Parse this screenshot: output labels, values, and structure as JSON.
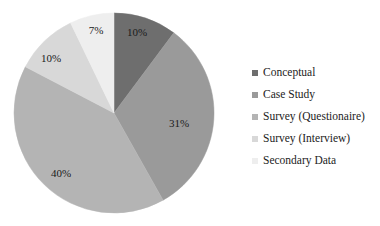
{
  "chart_data": {
    "type": "pie",
    "title": "",
    "categories": [
      "Conceptual",
      "Case Study",
      "Survey (Questionaire)",
      "Survey (Interview)",
      "Secondary Data"
    ],
    "values": [
      10,
      31,
      40,
      10,
      7
    ],
    "data_labels": [
      "10%",
      "31%",
      "40%",
      "10%",
      "7%"
    ],
    "colors": [
      "#6e6e6e",
      "#9a9a9a",
      "#b4b4b4",
      "#d8d8d8",
      "#eeeeee"
    ],
    "start_angle_deg": 0,
    "direction": "clockwise",
    "legend_position": "right",
    "grid": false,
    "value_unit": "%"
  },
  "legend": {
    "items": [
      {
        "label": "Conceptual",
        "color": "#6e6e6e"
      },
      {
        "label": "Case Study",
        "color": "#9a9a9a"
      },
      {
        "label": "Survey (Questionaire)",
        "color": "#b4b4b4"
      },
      {
        "label": "Survey (Interview)",
        "color": "#d8d8d8"
      },
      {
        "label": "Secondary Data",
        "color": "#eeeeee"
      }
    ]
  },
  "pie": {
    "center_x": 114,
    "center_y": 113,
    "radius": 100,
    "slices": [
      {
        "name": "Conceptual",
        "label": "10%",
        "value": 10,
        "color": "#6e6e6e",
        "label_x": 137,
        "label_y": 33
      },
      {
        "name": "Case Study",
        "label": "31%",
        "value": 31,
        "color": "#9a9a9a",
        "label_x": 179,
        "label_y": 124
      },
      {
        "name": "Survey (Questionaire)",
        "label": "40%",
        "value": 40,
        "color": "#b4b4b4",
        "label_x": 61,
        "label_y": 174
      },
      {
        "name": "Survey (Interview)",
        "label": "10%",
        "value": 10,
        "color": "#d8d8d8",
        "label_x": 51,
        "label_y": 59
      },
      {
        "name": "Secondary Data",
        "label": "7%",
        "value": 7,
        "color": "#eeeeee",
        "label_x": 96,
        "label_y": 31
      }
    ]
  }
}
